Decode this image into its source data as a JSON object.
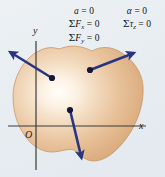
{
  "figure": {
    "caption_absent": true,
    "background_color": "#e9eef2",
    "body": {
      "name": "rigid-body-blob",
      "fill_light": "#fdf6ec",
      "fill_mid": "#e7bd93",
      "fill_edge": "#d4a271",
      "outline_color": "#c6946a"
    },
    "axes": {
      "color": "#2d2d2d",
      "x_label": "x",
      "y_label": "y",
      "origin_label": "O"
    },
    "vectors": {
      "color": "#2a3580",
      "items": [
        {
          "name": "force-vector-upper-left",
          "from_x": 52,
          "from_y": 78,
          "to_x": 6,
          "to_y": 50
        },
        {
          "name": "force-vector-upper-right",
          "from_x": 90,
          "from_y": 70,
          "to_x": 138,
          "to_y": 51
        },
        {
          "name": "force-vector-down",
          "from_x": 70,
          "from_y": 110,
          "to_x": 83,
          "to_y": 164
        }
      ]
    },
    "equations": {
      "left_column": {
        "name": "translational-equilibrium-equations",
        "line1_var": "a",
        "line1_rel": " = 0",
        "line2_sigma": "Σ",
        "line2_var": "F",
        "line2_sub": "x",
        "line2_rel": " = 0",
        "line3_sigma": "Σ",
        "line3_var": "F",
        "line3_sub": "y",
        "line3_rel": " = 0"
      },
      "right_column": {
        "name": "rotational-equilibrium-equations",
        "line1_var": "α",
        "line1_rel": " = 0",
        "line2_sigma": "Σ",
        "line2_var": "τ",
        "line2_sub": "z",
        "line2_rel": " = 0"
      }
    }
  }
}
